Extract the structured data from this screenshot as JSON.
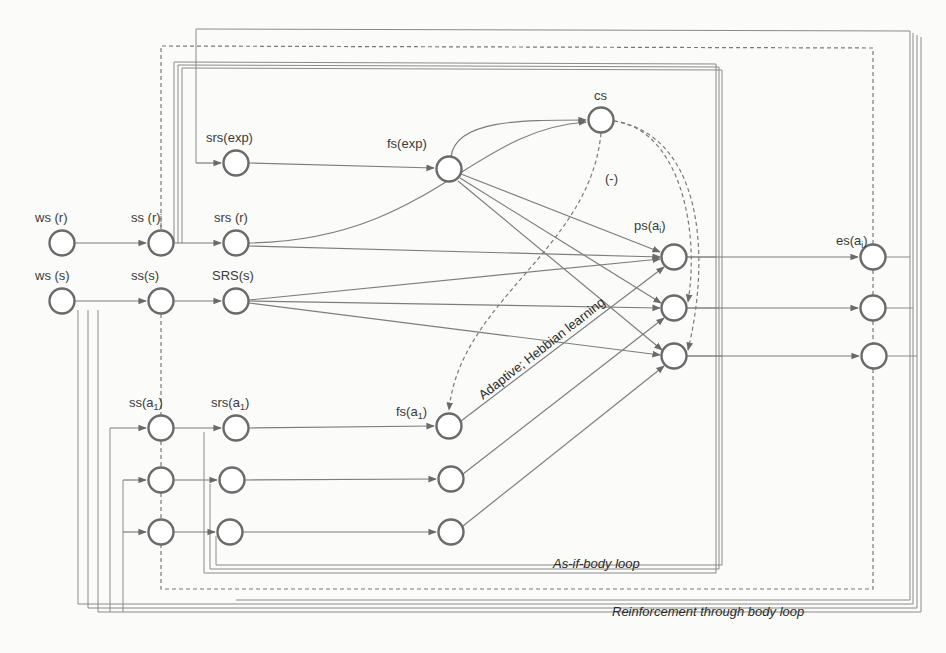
{
  "figure": {
    "type": "network-diagram",
    "colors": {
      "background": "#fbfbf9",
      "stroke": "#6a6a6a",
      "text": "#3a3a3a"
    },
    "nodes": {
      "ws_r": {
        "label": "ws (r)"
      },
      "ws_s": {
        "label": "ws (s)"
      },
      "ss_r": {
        "label": "ss (r)"
      },
      "ss_s": {
        "label": "ss(s)"
      },
      "ss_a1": {
        "label": "ss(a",
        "sub": "1",
        "close": ")"
      },
      "srs_exp": {
        "label": "srs(exp)"
      },
      "srs_r": {
        "label": "srs (r)"
      },
      "srs_s": {
        "label": "SRS(s)"
      },
      "srs_a1": {
        "label": "srs(a",
        "sub": "1",
        "close": ")"
      },
      "fs_exp": {
        "label": "fs(exp)"
      },
      "cs": {
        "label": "cs"
      },
      "fs_a1": {
        "label": "fs(a",
        "sub": "1",
        "close": ")"
      },
      "ps_a1": {
        "label": "ps(a",
        "sub": "i",
        "close": ")"
      },
      "es_a1": {
        "label": "es(a",
        "sub": "i",
        "close": ")"
      }
    },
    "annotations": {
      "suppression": "(-)",
      "hebbian": "Adaptive; Hebbian learning",
      "as_if_body_loop": "As-if-body loop",
      "body_loop": "Reinforcement through body loop"
    }
  }
}
